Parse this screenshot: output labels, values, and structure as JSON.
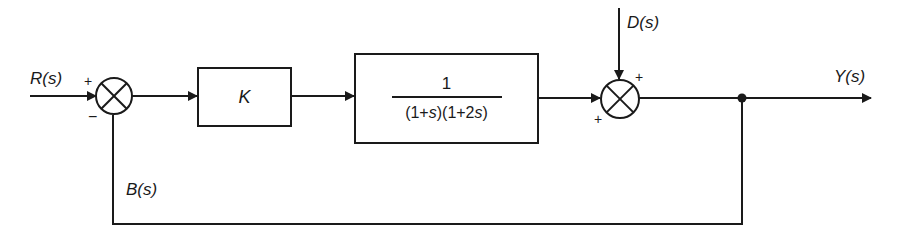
{
  "diagram": {
    "type": "block-diagram",
    "colors": {
      "stroke": "#1a1a1a",
      "background": "#ffffff"
    },
    "signals": {
      "input": "R(s)",
      "disturbance": "D(s)",
      "output": "Y(s)",
      "feedback": "B(s)"
    },
    "blocks": [
      {
        "id": "controller",
        "label": "K"
      },
      {
        "id": "plant",
        "numerator": "1",
        "denominator": "(1+s)(1+2s)"
      }
    ],
    "summing_junctions": [
      {
        "id": "sum1",
        "signs": {
          "reference": "+",
          "feedback": "−"
        }
      },
      {
        "id": "sum2",
        "signs": {
          "disturbance": "+",
          "plant": "+"
        }
      }
    ]
  }
}
